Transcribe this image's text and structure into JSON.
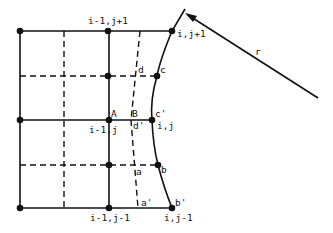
{
  "diagram": {
    "type": "finite-difference-grid-with-curved-boundary",
    "colors": {
      "ink": "#111111",
      "background": "#ffffff"
    },
    "node_labels": {
      "top_center": "i-1,j+1",
      "top_right": "i,j+1",
      "mid_center": "i-1,j",
      "mid_right": "i,j",
      "bottom_center": "i-1,j-1",
      "bottom_right": "i,j-1"
    },
    "point_labels": {
      "A": "A",
      "B": "B",
      "a": "a",
      "a_prime": "a'",
      "b": "b",
      "b_prime": "b'",
      "c": "c",
      "c_prime": "c'",
      "d": "d",
      "d_prime": "d'"
    },
    "vector_label": "r"
  }
}
